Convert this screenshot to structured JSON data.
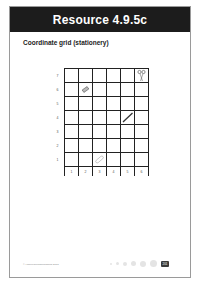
{
  "header": {
    "title": "Resource 4.9.5c"
  },
  "subtitle": "Coordinate grid (stationery)",
  "grid": {
    "y_labels": [
      "7",
      "6",
      "5",
      "4",
      "3",
      "2",
      "1"
    ],
    "x_labels": [
      "1",
      "2",
      "3",
      "4",
      "5",
      "6"
    ],
    "items": [
      {
        "name": "scissors",
        "x": 6,
        "y": 7
      },
      {
        "name": "eraser",
        "x": 2,
        "y": 6
      },
      {
        "name": "pencil",
        "x": 5,
        "y": 4
      },
      {
        "name": "paperclip",
        "x": 3,
        "y": 1
      }
    ]
  },
  "footer": {
    "copyright": "© HarperCollinsPublishers 2018",
    "page_number": "201"
  }
}
